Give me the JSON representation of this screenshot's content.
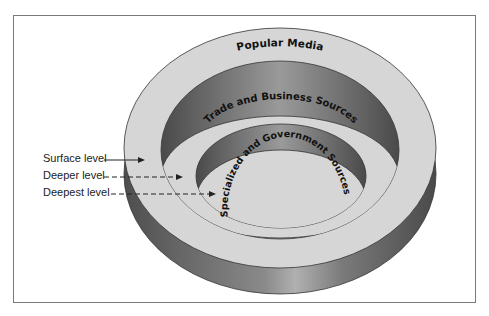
{
  "diagram": {
    "rings": [
      {
        "label": "Popular Media"
      },
      {
        "label": "Trade and Business Sources"
      },
      {
        "label": "Specialized and Government Sources"
      }
    ],
    "levels": [
      {
        "label": "Surface level",
        "line": "solid"
      },
      {
        "label": "Deeper level",
        "line": "dashed"
      },
      {
        "label": "Deepest level",
        "line": "dashed"
      }
    ],
    "colors": {
      "face": "#d6d6d6",
      "wall_dark": "#5e5e5e",
      "wall_light": "#a8a8a8",
      "outline": "#333333"
    }
  }
}
